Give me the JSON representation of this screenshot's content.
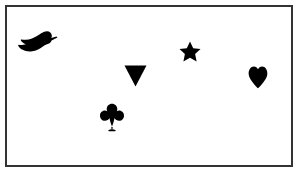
{
  "scene": {
    "title": "Visual search array of black silhouette shapes",
    "width": 304,
    "height": 174,
    "background_color": "#ffffff",
    "frame": {
      "border_color": "#333333",
      "border_width": 2,
      "fill_color": "#ffffff",
      "x": 5,
      "y": 5,
      "width": 288,
      "height": 162
    },
    "shape_color": "#000000",
    "item_count": 5,
    "items": [
      {
        "id": "duck",
        "name": "duck-shape",
        "label": "Duck",
        "x": 18,
        "y": 30,
        "width": 39,
        "height": 23,
        "orientation": "facing-right",
        "color": "#000000"
      },
      {
        "id": "triangle",
        "name": "triangle-shape",
        "label": "Inverted triangle",
        "x": 124,
        "y": 65,
        "width": 22,
        "height": 21,
        "orientation": "point-down",
        "color": "#000000"
      },
      {
        "id": "star",
        "name": "star-shape",
        "label": "Five-pointed star",
        "x": 179,
        "y": 41,
        "width": 21,
        "height": 20,
        "orientation": "point-up",
        "color": "#000000"
      },
      {
        "id": "heart",
        "name": "heart-shape",
        "label": "Heart",
        "x": 248,
        "y": 65,
        "width": 19,
        "height": 23,
        "orientation": "upright",
        "color": "#000000"
      },
      {
        "id": "club",
        "name": "club-shape",
        "label": "Club",
        "x": 100,
        "y": 103,
        "width": 23,
        "height": 28,
        "orientation": "upright",
        "color": "#000000"
      }
    ]
  }
}
